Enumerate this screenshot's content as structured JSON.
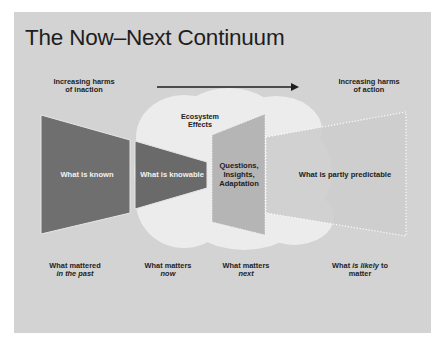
{
  "slide": {
    "title": "The Now–Next Continuum",
    "colors": {
      "background": "#d3d3d3",
      "known_fill": "#6f6f6f",
      "knowable_fill": "#6a6a6a",
      "questions_fill": "#b4b4b4",
      "predictable_fill": "#cbcbcb",
      "cloud_fill": "#ededed",
      "arrow": "#1e1e1e",
      "dotted_outline": "#ffffff"
    }
  },
  "header": {
    "left_label_line1": "Increasing harms",
    "left_label_line2": "of inaction",
    "right_label_line1": "Increasing harms",
    "right_label_line2": "of action",
    "arrow_direction": "right"
  },
  "cloud": {
    "label_line1": "Ecosystem",
    "label_line2": "Effects"
  },
  "shapes": [
    {
      "id": "known",
      "label": "What is known"
    },
    {
      "id": "knowable",
      "label": "What is knowable"
    },
    {
      "id": "questions",
      "label_line1": "Questions,",
      "label_line2": "Insights,",
      "label_line3": "Adaptation"
    },
    {
      "id": "predictable",
      "label": "What is partly predictable"
    }
  ],
  "bottom_labels": [
    {
      "line1": "What mattered",
      "line2": "in the past",
      "line2_style": "italic"
    },
    {
      "line1": "What matters",
      "line2": "now",
      "line2_style": "italic"
    },
    {
      "line1": "What matters",
      "line2": "next",
      "line2_style": "italic"
    },
    {
      "line1_a": "What ",
      "line1_b": "is likely",
      "line1_c": " to",
      "line2": "matter",
      "italic_part": "is likely"
    }
  ]
}
